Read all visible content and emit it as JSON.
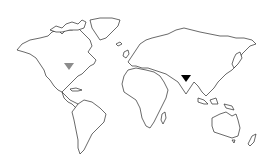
{
  "map": {
    "type": "world-outline",
    "land_stroke_color": "#2a2a2a",
    "background_color": "#ffffff"
  },
  "markers": [
    {
      "name": "marker-north-america",
      "shape": "triangle-down",
      "color": "#8c8c8c",
      "x": 69,
      "y": 67
    },
    {
      "name": "marker-south-asia",
      "shape": "triangle-down",
      "color": "#000000",
      "x": 186,
      "y": 79
    }
  ]
}
